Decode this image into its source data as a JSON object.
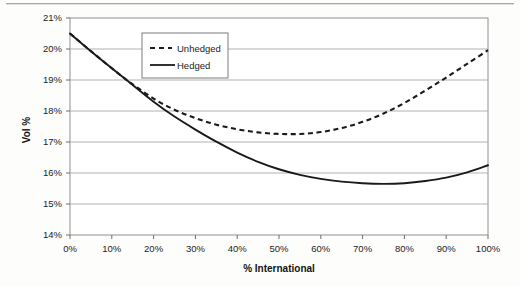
{
  "chart_data": {
    "type": "line",
    "title": "",
    "xlabel": "% International",
    "ylabel": "Vol %",
    "xlim": [
      0,
      100
    ],
    "ylim": [
      14,
      21
    ],
    "grid": true,
    "grid_axis": "y",
    "legend_position": "top-center-inside",
    "x_tick_labels": [
      "0%",
      "10%",
      "20%",
      "30%",
      "40%",
      "50%",
      "60%",
      "70%",
      "80%",
      "90%",
      "100%"
    ],
    "x_ticks": [
      0,
      10,
      20,
      30,
      40,
      50,
      60,
      70,
      80,
      90,
      100
    ],
    "y_tick_labels": [
      "14%",
      "15%",
      "16%",
      "17%",
      "18%",
      "19%",
      "20%",
      "21%"
    ],
    "y_ticks": [
      14,
      15,
      16,
      17,
      18,
      19,
      20,
      21
    ],
    "x": [
      0,
      5,
      10,
      13,
      15,
      20,
      25,
      30,
      35,
      40,
      45,
      50,
      55,
      60,
      65,
      70,
      75,
      80,
      85,
      90,
      95,
      100
    ],
    "series": [
      {
        "name": "Unhedged",
        "style": "dashed",
        "color": "#1a1a1a",
        "values": [
          20.5,
          19.93,
          19.38,
          19.06,
          18.86,
          18.4,
          18.04,
          17.77,
          17.56,
          17.41,
          17.31,
          17.26,
          17.26,
          17.32,
          17.45,
          17.65,
          17.92,
          18.26,
          18.66,
          19.08,
          19.52,
          19.96
        ]
      },
      {
        "name": "Hedged",
        "style": "solid",
        "color": "#1a1a1a",
        "values": [
          20.5,
          19.93,
          19.38,
          19.06,
          18.84,
          18.3,
          17.82,
          17.4,
          17.01,
          16.66,
          16.36,
          16.12,
          15.94,
          15.81,
          15.72,
          15.67,
          15.65,
          15.67,
          15.74,
          15.85,
          16.02,
          16.25
        ]
      }
    ],
    "annotations": []
  },
  "legend": {
    "entries": [
      {
        "label": "Unhedged",
        "marker": "dashed-line"
      },
      {
        "label": "Hedged",
        "marker": "solid-line"
      }
    ]
  }
}
